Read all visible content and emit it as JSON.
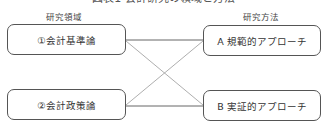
{
  "figure": {
    "title": "図表1 会計研究の領域と方法"
  },
  "columns": {
    "left_label": "研究領域",
    "right_label": "研究方法"
  },
  "research_areas": [
    {
      "label": "①会計基準論"
    },
    {
      "label": "②会計政策論"
    }
  ],
  "research_methods": [
    {
      "label": "A 規範的アプローチ"
    },
    {
      "label": "B 実証的アプローチ"
    }
  ],
  "connections": [
    {
      "from": "①会計基準論",
      "to": "A 規範的アプローチ"
    },
    {
      "from": "①会計基準論",
      "to": "B 実証的アプローチ"
    },
    {
      "from": "②会計政策論",
      "to": "A 規範的アプローチ"
    },
    {
      "from": "②会計政策論",
      "to": "B 実証的アプローチ"
    }
  ],
  "colors": {
    "border": "#555555",
    "line": "#888888",
    "text": "#333333"
  }
}
